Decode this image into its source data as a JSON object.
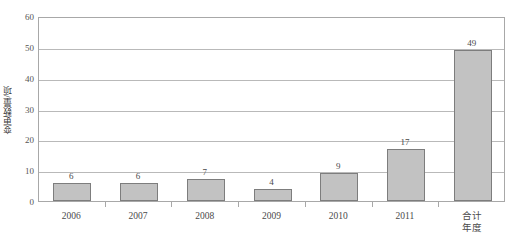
{
  "chart_data": {
    "type": "bar",
    "title": "",
    "subtitle": "",
    "xlabel": "年度",
    "ylabel": "变更数量/项",
    "categories": [
      "2006",
      "2007",
      "2008",
      "2009",
      "2010",
      "2011",
      "合计"
    ],
    "values": [
      6,
      6,
      7,
      4,
      9,
      17,
      49
    ],
    "data_labels": [
      "6",
      "6",
      "7",
      "4",
      "9",
      "17",
      "49"
    ],
    "ylim": [
      0,
      60
    ],
    "ytick_labels": [
      "0",
      "10",
      "20",
      "30",
      "40",
      "50",
      "60"
    ],
    "ytick_values": [
      0,
      10,
      20,
      30,
      40,
      50,
      60
    ],
    "grid": "horizontal",
    "legend": "none",
    "bar_fill_color": "#c2c2c2",
    "bar_border_color": "#7d7d7d",
    "gridline_color": "#b9b9b9",
    "axis_color": "#a8a8a8",
    "text_color": "#4a4a4a",
    "background_color": "#ffffff"
  }
}
